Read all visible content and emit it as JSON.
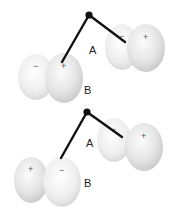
{
  "diagram": {
    "top": {
      "pivot": {
        "x": 89,
        "y": 15
      },
      "molecule_a": {
        "label": "A",
        "label_pos": {
          "x": 89,
          "y": 54
        },
        "left_lobe": {
          "cx": 122,
          "cy": 47,
          "rx": 17,
          "ry": 23,
          "sign": "−"
        },
        "right_lobe": {
          "cx": 146,
          "cy": 48,
          "rx": 19,
          "ry": 24,
          "sign": "+"
        },
        "rod_end": {
          "x": 125,
          "y": 42
        }
      },
      "molecule_b": {
        "label": "B",
        "label_pos": {
          "x": 84,
          "y": 94
        },
        "left_lobe": {
          "cx": 36,
          "cy": 77,
          "rx": 18,
          "ry": 23,
          "sign": "−"
        },
        "right_lobe": {
          "cx": 64,
          "cy": 78,
          "rx": 19,
          "ry": 25,
          "sign": "+"
        },
        "rod_end": {
          "x": 62,
          "y": 62
        }
      }
    },
    "bottom": {
      "pivot": {
        "x": 87,
        "y": 112
      },
      "molecule_a": {
        "label": "A",
        "label_pos": {
          "x": 86,
          "y": 147
        },
        "left_lobe": {
          "cx": 114,
          "cy": 140,
          "rx": 17,
          "ry": 22,
          "sign": "−"
        },
        "right_lobe": {
          "cx": 144,
          "cy": 147,
          "rx": 19,
          "ry": 24,
          "sign": "+"
        },
        "rod_end": {
          "x": 122,
          "y": 137
        }
      },
      "molecule_b": {
        "label": "B",
        "label_pos": {
          "x": 84,
          "y": 187
        },
        "left_lobe": {
          "cx": 31,
          "cy": 180,
          "rx": 17,
          "ry": 23,
          "sign": "+"
        },
        "right_lobe": {
          "cx": 62,
          "cy": 182,
          "rx": 19,
          "ry": 25,
          "sign": "−"
        },
        "rod_end": {
          "x": 61,
          "y": 158
        }
      }
    },
    "colors": {
      "lobe_light": "#fafafa",
      "lobe_mid": "#e4e4e4",
      "lobe_dark": "#c8c8c8",
      "rod": "#111111",
      "text": "#222222"
    }
  }
}
